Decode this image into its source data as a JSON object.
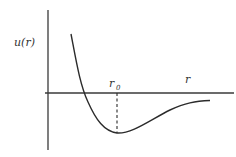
{
  "diagram": {
    "y_axis_label": "u(r)",
    "x_axis_label": "r",
    "equilibrium_label": "r",
    "equilibrium_subscript": "0",
    "colors": {
      "line": "#2b2b2b",
      "axis": "#3a3a3a",
      "text": "#333333",
      "background": "#ffffff"
    }
  }
}
